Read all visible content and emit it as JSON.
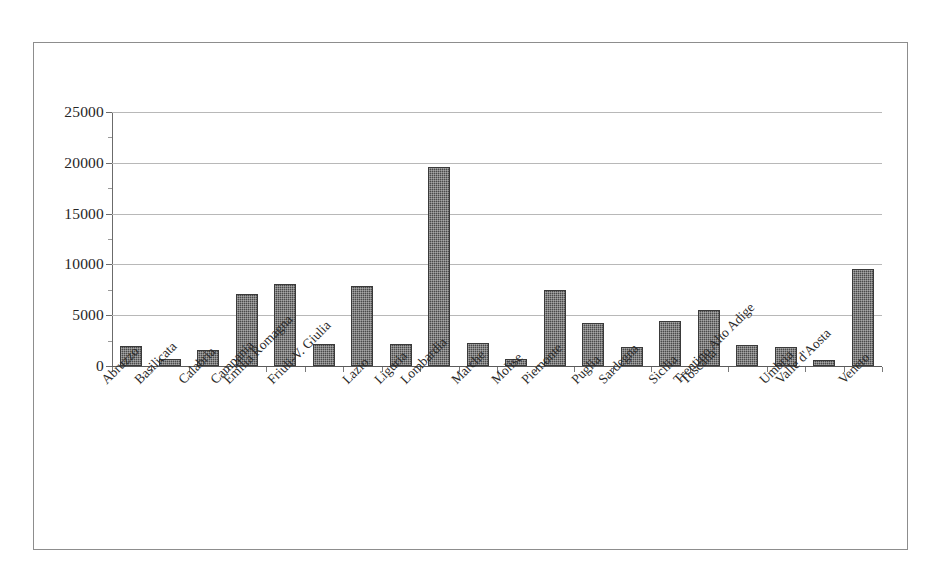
{
  "chart_data": {
    "type": "bar",
    "title": "",
    "subtitle": "",
    "xlabel": "",
    "ylabel": "",
    "ylim": [
      0,
      25000
    ],
    "ytick_step": 5000,
    "ytick_labels": [
      "25000",
      "20000",
      "15000",
      "10000",
      "5000",
      "0"
    ],
    "ytick_values": [
      25000,
      20000,
      15000,
      10000,
      5000,
      0
    ],
    "grid": true,
    "legend": false,
    "legend_position": "none",
    "bar_color": "#4a4a4a",
    "categories": [
      "Abruzzo",
      "Basilicata",
      "Calabria",
      "Campania",
      "Emilia Romagna",
      "Friuli-V. Giulia",
      "Lazio",
      "Liguria",
      "Lombardia",
      "Marche",
      "Molise",
      "Piemonte",
      "Puglia",
      "Sardegna",
      "Sicilia",
      "Toscana",
      "Trentino Alto Adige",
      "Umbria",
      "Valle d'Aosta",
      "Veneto"
    ],
    "values": [
      2000,
      700,
      1600,
      7100,
      8100,
      2200,
      7900,
      2200,
      19600,
      2300,
      650,
      7500,
      4200,
      1900,
      4400,
      5500,
      2100,
      1900,
      550,
      9500
    ]
  }
}
